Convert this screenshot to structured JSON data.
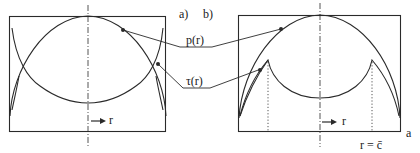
{
  "figure": {
    "panel_labels": {
      "a": "a)",
      "b": "b)"
    },
    "curve_labels": {
      "pressure": "p(r)",
      "shear": "τ(r)"
    },
    "axis_labels": {
      "left_r": "r",
      "right_r": "r",
      "radius_a": "a",
      "critical_radius": "r = c̄"
    },
    "colors": {
      "line": "#2a2a2a",
      "background": "#ffffff"
    }
  }
}
